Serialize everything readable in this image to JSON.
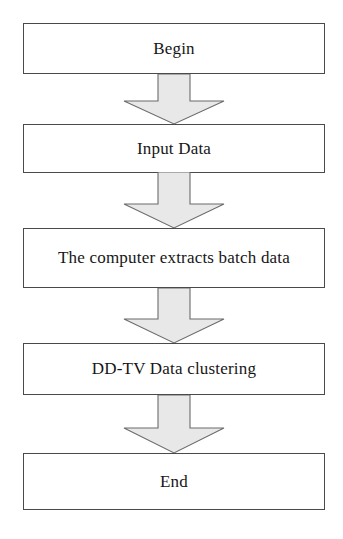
{
  "diagram": {
    "orientation": "top-to-bottom",
    "canvas": {
      "width": 343,
      "height": 539
    },
    "style": {
      "box_fill": "#ffffff",
      "box_stroke": "#4a4a4a",
      "arrow_fill": "#e8e8e8",
      "arrow_stroke": "#6b6b6b",
      "text_color": "#161616"
    },
    "nodes": [
      {
        "id": "begin",
        "label": "Begin",
        "shape": "rectangle",
        "x": 23,
        "y": 23,
        "width": 302,
        "height": 51,
        "font_size": 17
      },
      {
        "id": "input-data",
        "label": "Input Data",
        "shape": "rectangle",
        "x": 23,
        "y": 124,
        "width": 302,
        "height": 49,
        "font_size": 17
      },
      {
        "id": "extract-batch-data",
        "label": "The computer extracts batch data",
        "shape": "rectangle",
        "x": 23,
        "y": 228,
        "width": 302,
        "height": 60,
        "font_size": 17
      },
      {
        "id": "ddtv-clustering",
        "label": "DD-TV Data clustering",
        "shape": "rectangle",
        "x": 23,
        "y": 343,
        "width": 302,
        "height": 52,
        "font_size": 17
      },
      {
        "id": "end",
        "label": "End",
        "shape": "rectangle",
        "x": 23,
        "y": 453,
        "width": 302,
        "height": 57,
        "font_size": 17
      }
    ],
    "edges": [
      {
        "id": "edge-begin-to-input",
        "from": "begin",
        "to": "input-data",
        "label": "",
        "x": 122,
        "y": 74,
        "width": 104,
        "height": 51,
        "shaft_half_width": 16,
        "head_height": 24
      },
      {
        "id": "edge-input-to-extract",
        "from": "input-data",
        "to": "extract-batch-data",
        "label": "",
        "x": 122,
        "y": 172,
        "width": 104,
        "height": 57,
        "shaft_half_width": 16,
        "head_height": 26
      },
      {
        "id": "edge-extract-to-clustering",
        "from": "extract-batch-data",
        "to": "ddtv-clustering",
        "label": "",
        "x": 122,
        "y": 288,
        "width": 104,
        "height": 56,
        "shaft_half_width": 16,
        "head_height": 26
      },
      {
        "id": "edge-clustering-to-end",
        "from": "ddtv-clustering",
        "to": "end",
        "label": "",
        "x": 122,
        "y": 395,
        "width": 104,
        "height": 59,
        "shaft_half_width": 16,
        "head_height": 27
      }
    ]
  }
}
